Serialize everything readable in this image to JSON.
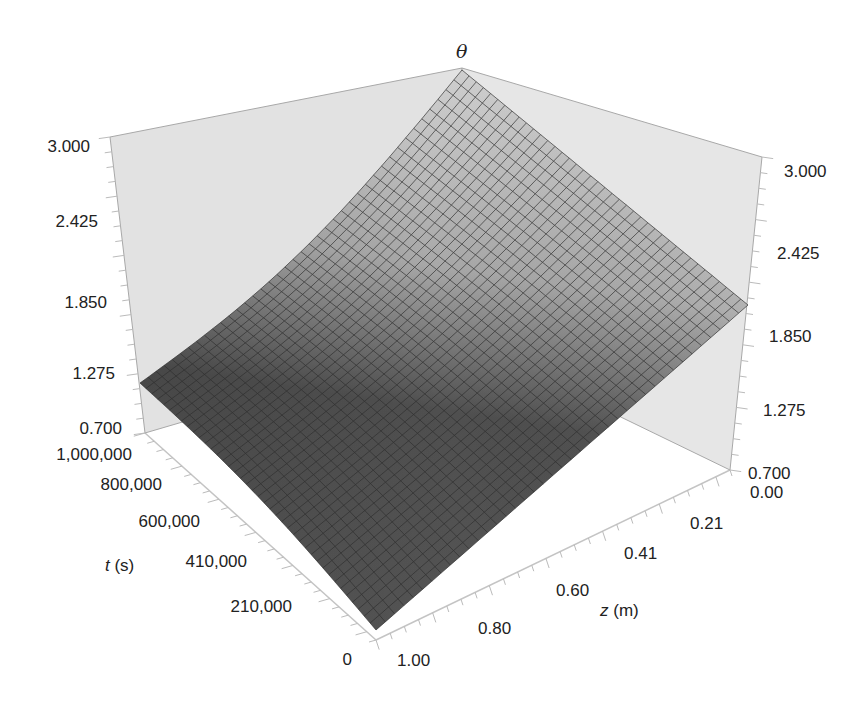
{
  "chart_data": {
    "type": "surface",
    "title": "",
    "zlabel": "θ",
    "xlabel": "z (m)",
    "ylabel": "t (s)",
    "x_axis": {
      "name": "z",
      "unit": "m",
      "ticks": [
        "0.00",
        "0.21",
        "0.41",
        "0.60",
        "0.80",
        "1.00"
      ],
      "range": [
        0.0,
        1.0
      ]
    },
    "y_axis": {
      "name": "t",
      "unit": "s",
      "ticks": [
        "0",
        "210,000",
        "410,000",
        "600,000",
        "800,000",
        "1,000,000"
      ],
      "range": [
        0,
        1000000
      ]
    },
    "z_axis": {
      "name": "θ",
      "ticks_left": [
        "0.700",
        "1.275",
        "1.850",
        "2.425",
        "3.000"
      ],
      "ticks_right": [
        "0.700",
        "1.275",
        "1.850",
        "2.425",
        "3.000"
      ],
      "range": [
        0.7,
        3.0
      ]
    },
    "surface_corners": [
      {
        "z": 0.0,
        "t": 1000000,
        "theta": 3.0
      },
      {
        "z": 1.0,
        "t": 1000000,
        "theta": 1.2
      },
      {
        "z": 0.0,
        "t": 0,
        "theta": 1.95
      },
      {
        "z": 1.0,
        "t": 0,
        "theta": 0.7
      }
    ],
    "grid": true,
    "mesh_lines": 40,
    "colors": {
      "surface_dark": "#4a4a4a",
      "surface_light": "#b8b8b8",
      "mesh": "#333333",
      "wall": "#dcdcdc",
      "wall_edge": "#9a9a9a"
    }
  },
  "labels": {
    "theta": "θ",
    "t_axis_var": "t",
    "t_axis_unit": " (s)",
    "z_axis_var": "z",
    "z_axis_unit": " (m)"
  }
}
